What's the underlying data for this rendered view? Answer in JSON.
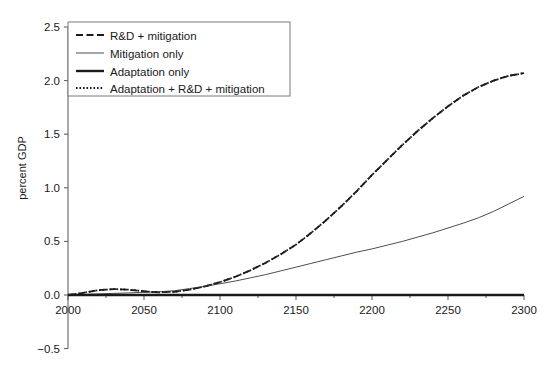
{
  "chart_data": {
    "type": "line",
    "title": "",
    "xlabel": "",
    "ylabel": "percent GDP",
    "xlim": [
      2000,
      2300
    ],
    "ylim": [
      -0.5,
      2.5
    ],
    "xticks": [
      2000,
      2050,
      2100,
      2150,
      2200,
      2250,
      2300
    ],
    "xtick_labels": [
      "2000",
      "2050",
      "2100",
      "2150",
      "2200",
      "2250",
      "2300"
    ],
    "xminor_ticks": [
      2025,
      2075,
      2125,
      2175,
      2225,
      2275
    ],
    "yticks": [
      -0.5,
      0.0,
      0.5,
      1.0,
      1.5,
      2.0,
      2.5
    ],
    "ytick_labels": [
      "-0.5",
      "0.0",
      "0.5",
      "1.0",
      "1.5",
      "2.0",
      "2.5"
    ],
    "grid": false,
    "legend_position": "upper-left",
    "x": [
      2000,
      2010,
      2020,
      2030,
      2040,
      2050,
      2060,
      2070,
      2080,
      2090,
      2100,
      2110,
      2120,
      2130,
      2140,
      2150,
      2160,
      2170,
      2180,
      2190,
      2200,
      2210,
      2220,
      2230,
      2240,
      2250,
      2260,
      2270,
      2280,
      2290,
      2300
    ],
    "series": [
      {
        "name": "R&D + mitigation",
        "style": "dashed",
        "width": 1.8,
        "color": "#1a1a1a",
        "values": [
          0.0,
          0.02,
          0.045,
          0.055,
          0.05,
          0.035,
          0.025,
          0.03,
          0.05,
          0.08,
          0.12,
          0.17,
          0.23,
          0.3,
          0.38,
          0.47,
          0.58,
          0.7,
          0.83,
          0.97,
          1.12,
          1.26,
          1.4,
          1.53,
          1.65,
          1.76,
          1.86,
          1.94,
          2.0,
          2.045,
          2.07
        ]
      },
      {
        "name": "Mitigation only",
        "style": "solid",
        "width": 0.9,
        "color": "#3a3a3a",
        "values": [
          0.0,
          0.005,
          0.01,
          0.015,
          0.02,
          0.025,
          0.03,
          0.04,
          0.06,
          0.08,
          0.105,
          0.13,
          0.16,
          0.19,
          0.225,
          0.26,
          0.295,
          0.33,
          0.365,
          0.4,
          0.43,
          0.465,
          0.5,
          0.54,
          0.58,
          0.625,
          0.67,
          0.72,
          0.78,
          0.85,
          0.92
        ]
      },
      {
        "name": "Adaptation only",
        "style": "solid",
        "width": 2.4,
        "color": "#1a1a1a",
        "values": [
          0.0,
          0.0,
          0.0,
          0.0,
          0.0,
          0.0,
          0.0,
          0.0,
          0.0,
          0.0,
          0.0,
          0.0,
          0.0,
          0.0,
          0.0,
          0.0,
          0.0,
          0.0,
          0.0,
          0.0,
          0.0,
          0.0,
          0.0,
          0.0,
          0.0,
          0.0,
          0.0,
          0.0,
          0.0,
          0.0,
          0.0
        ]
      },
      {
        "name": "Adaptation + R&D + mitigation",
        "style": "dotted",
        "width": 1.8,
        "color": "#1a1a1a",
        "values": [
          0.0,
          0.02,
          0.045,
          0.055,
          0.05,
          0.035,
          0.025,
          0.03,
          0.05,
          0.08,
          0.12,
          0.17,
          0.23,
          0.3,
          0.38,
          0.47,
          0.58,
          0.7,
          0.83,
          0.97,
          1.12,
          1.26,
          1.4,
          1.53,
          1.65,
          1.76,
          1.86,
          1.94,
          2.0,
          2.045,
          2.07
        ]
      }
    ]
  },
  "legend": {
    "items": [
      {
        "label": "R&D + mitigation"
      },
      {
        "label": "Mitigation only"
      },
      {
        "label": "Adaptation only"
      },
      {
        "label": "Adaptation + R&D + mitigation"
      }
    ]
  }
}
